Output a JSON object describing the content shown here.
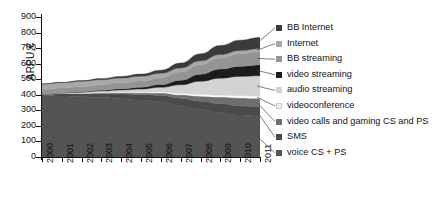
{
  "chart_data": {
    "type": "area",
    "stacked": true,
    "title": "",
    "xlabel": "",
    "ylabel": "ARPU,€",
    "categories": [
      "2000",
      "2001",
      "2002",
      "2003",
      "2004",
      "2005",
      "2006",
      "2007",
      "2008",
      "2009",
      "2010",
      "2011"
    ],
    "x": [
      2000,
      2001,
      2002,
      2003,
      2004,
      2005,
      2006,
      2007,
      2008,
      2009,
      2010,
      2011
    ],
    "ylim": [
      0,
      900
    ],
    "yticks": [
      0,
      100,
      200,
      300,
      400,
      500,
      600,
      700,
      800,
      900
    ],
    "grid": false,
    "legend_position": "right",
    "series": [
      {
        "name": "voice CS + PS",
        "color": "#545454",
        "values": [
          395,
          392,
          388,
          382,
          375,
          366,
          355,
          330,
          305,
          285,
          270,
          262
        ]
      },
      {
        "name": "SMS",
        "color": "#4a4a4a",
        "values": [
          10,
          14,
          18,
          24,
          30,
          36,
          42,
          48,
          54,
          58,
          60,
          60
        ]
      },
      {
        "name": "video calls and gaming CS and PS",
        "color": "#6f6f6f",
        "values": [
          0,
          2,
          4,
          6,
          8,
          10,
          14,
          22,
          32,
          42,
          50,
          55
        ]
      },
      {
        "name": "videoconference",
        "color": "#fbfbfb",
        "values": [
          0,
          1,
          2,
          3,
          4,
          5,
          7,
          9,
          11,
          12,
          13,
          13
        ]
      },
      {
        "name": "audio streaming",
        "color": "#d3d3d3",
        "values": [
          0,
          2,
          5,
          9,
          14,
          20,
          30,
          55,
          85,
          110,
          125,
          132
        ]
      },
      {
        "name": "video streaming",
        "color": "#1c1c1c",
        "values": [
          0,
          1,
          3,
          5,
          8,
          12,
          18,
          30,
          45,
          58,
          66,
          70
        ]
      },
      {
        "name": "BB streaming",
        "color": "#949494",
        "values": [
          30,
          32,
          34,
          36,
          38,
          40,
          44,
          52,
          62,
          72,
          80,
          84
        ]
      },
      {
        "name": "Internet",
        "color": "#a8a8a8",
        "values": [
          35,
          34,
          33,
          32,
          31,
          30,
          28,
          26,
          24,
          22,
          21,
          20
        ]
      },
      {
        "name": "BB Internet",
        "color": "#3b3b3b",
        "values": [
          0,
          2,
          4,
          7,
          10,
          14,
          20,
          32,
          46,
          58,
          66,
          72
        ]
      }
    ]
  },
  "axis": {
    "y_label": "ARPU,€",
    "y_tick_labels": [
      "900",
      "800",
      "700",
      "600",
      "500",
      "400",
      "300",
      "200",
      "100",
      "0"
    ],
    "x_tick_labels": [
      "2000",
      "2001",
      "2002",
      "2003",
      "2004",
      "2005",
      "2006",
      "2007",
      "2008",
      "2009",
      "2010",
      "2011"
    ]
  },
  "legend": {
    "items": [
      {
        "label": "BB Internet",
        "color": "#3b3b3b"
      },
      {
        "label": "Internet",
        "color": "#a8a8a8"
      },
      {
        "label": "BB streaming",
        "color": "#949494"
      },
      {
        "label": "video streaming",
        "color": "#1c1c1c"
      },
      {
        "label": "audio streaming",
        "color": "#d3d3d3"
      },
      {
        "label": "videoconference",
        "color": "#f2f2f2"
      },
      {
        "label": "video calls and gaming CS and PS",
        "color": "#6f6f6f"
      },
      {
        "label": "SMS",
        "color": "#4a4a4a"
      },
      {
        "label": "voice CS + PS",
        "color": "#545454"
      }
    ]
  }
}
